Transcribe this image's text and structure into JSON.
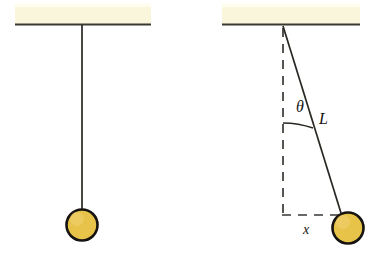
{
  "figure": {
    "background_color": "#ffffff",
    "ink_color": "#1a1714",
    "ceiling_fill": "#faf6dc",
    "ceiling_edge_color": "#3b3830",
    "bob_fill": "#e8c34a",
    "bob_outline_color": "#161310",
    "string_color": "#2a2723"
  },
  "panels": [
    {
      "id": "rest",
      "name": "pendulum-at-rest",
      "ceiling": {
        "x": 15,
        "y": 3,
        "width": 136,
        "height": 21
      },
      "pivot": {
        "x": 82,
        "y": 25
      },
      "bob": {
        "cx": 82,
        "cy": 225,
        "r": 16
      },
      "string": {
        "x1": 82,
        "y1": 25,
        "x2": 82,
        "y2": 209
      },
      "labels": []
    },
    {
      "id": "displaced",
      "name": "pendulum-displaced",
      "ceiling": {
        "x": 222,
        "y": 3,
        "width": 138,
        "height": 21
      },
      "pivot": {
        "x": 283,
        "y": 26
      },
      "bob": {
        "cx": 348,
        "cy": 228,
        "r": 16
      },
      "string": {
        "x1": 283,
        "y1": 26,
        "x2": 343,
        "y2": 214
      },
      "vertical_dashed": {
        "x1": 283,
        "y1": 30,
        "x2": 283,
        "y2": 215
      },
      "horizontal_dashed": {
        "x1": 283,
        "y1": 215,
        "x2": 338,
        "y2": 215
      },
      "angle_arc": {
        "cx": 283,
        "cy": 26,
        "r": 94,
        "start_deg": 72,
        "end_deg": 90
      },
      "labels": [
        {
          "id": "theta",
          "text": "θ",
          "x": 298,
          "y": 108,
          "size": 15,
          "style": "italic"
        },
        {
          "id": "length",
          "text": "L",
          "x": 322,
          "y": 122,
          "size": 15,
          "style": "italic"
        },
        {
          "id": "displacement",
          "text": "x",
          "x": 305,
          "y": 233,
          "size": 13,
          "style": "italic"
        }
      ]
    }
  ],
  "annotations": {
    "theta_label": "θ",
    "length_label": "L",
    "displacement_label": "x"
  }
}
